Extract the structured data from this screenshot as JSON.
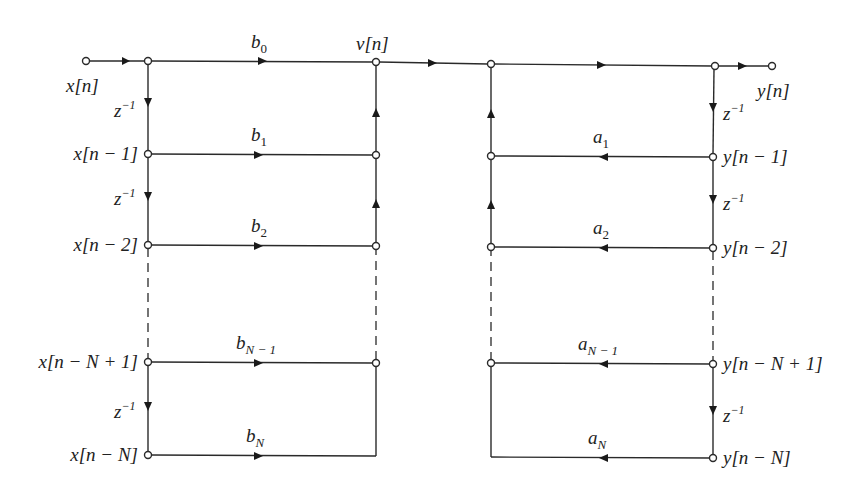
{
  "diagram": {
    "type": "signal-flow-graph",
    "input": {
      "label": "x[n]"
    },
    "output": {
      "label": "y[n]"
    },
    "intermediate": {
      "label": "v[n]"
    },
    "delay_label": "z",
    "delay_exponent": "−1",
    "feedforward": {
      "tap_labels": [
        "x[n]",
        "x[n − 1]",
        "x[n − 2]",
        "x[n − N + 1]",
        "x[n − N]"
      ],
      "coefficients": [
        {
          "base": "b",
          "sub": "0"
        },
        {
          "base": "b",
          "sub": "1"
        },
        {
          "base": "b",
          "sub": "2"
        },
        {
          "base": "b",
          "sub": "N − 1"
        },
        {
          "base": "b",
          "sub": "N"
        }
      ]
    },
    "feedback": {
      "tap_labels": [
        "y[n − 1]",
        "y[n − 2]",
        "y[n − N + 1]",
        "y[n − N]"
      ],
      "coefficients": [
        {
          "base": "a",
          "sub": "1"
        },
        {
          "base": "a",
          "sub": "2"
        },
        {
          "base": "a",
          "sub": "N − 1"
        },
        {
          "base": "a",
          "sub": "N"
        }
      ]
    },
    "colors": {
      "line": "#2a2a2a",
      "background": "#ffffff"
    }
  }
}
